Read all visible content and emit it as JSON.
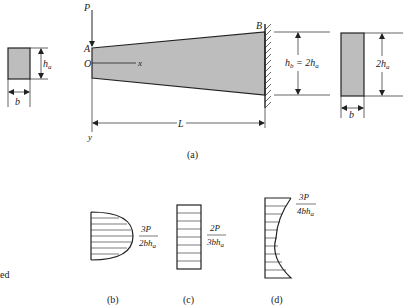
{
  "figure": {
    "colors": {
      "ink": "#222222",
      "fill": "#bdbdbd",
      "background": "#ffffff"
    },
    "panel_a": {
      "caption": "(a)",
      "load_label": "P",
      "point_a_label": "A",
      "point_b_label": "B",
      "origin_label": "O",
      "x_axis_label": "x",
      "y_axis_label": "y",
      "length_label": "L",
      "left_section": {
        "height_label": "h",
        "height_sub": "a",
        "width_label": "b"
      },
      "fixed_end_height": {
        "label": "h",
        "label_sub": "b",
        "equals": " = 2h",
        "equals_sub": "a"
      },
      "right_section": {
        "height_label": "2h",
        "height_sub": "a",
        "width_label": "b"
      }
    },
    "panel_b": {
      "caption": "(b)",
      "shape": "parabolic stress distribution",
      "numerator": "3P",
      "denominator": "2bh",
      "denominator_sub": "a"
    },
    "panel_c": {
      "caption": "(c)",
      "shape": "uniform stress distribution",
      "numerator": "2P",
      "denominator": "3bh",
      "denominator_sub": "a"
    },
    "panel_d": {
      "caption": "(d)",
      "shape": "concave stress distribution",
      "numerator": "3P",
      "denominator": "4bh",
      "denominator_sub": "a"
    },
    "margin_text": "ed"
  }
}
